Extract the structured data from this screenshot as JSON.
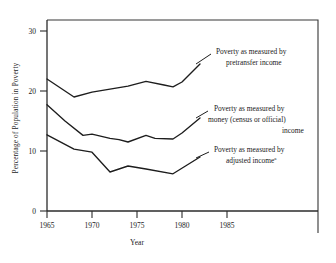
{
  "chart_data": {
    "type": "line",
    "title": "",
    "xlabel": "Year",
    "ylabel": "Percentage of Population in Poverty",
    "xlim": [
      1965,
      1987
    ],
    "ylim": [
      0,
      32
    ],
    "xticks": [
      1965,
      1970,
      1975,
      1980,
      1985
    ],
    "xticklabels": [
      "1965",
      "1970",
      "1975",
      "1980",
      "1985"
    ],
    "yticks": [
      0,
      10,
      20,
      30
    ],
    "yticklabels": [
      "0",
      "10",
      "20",
      "30"
    ],
    "grid": false,
    "legend_position": "inline-annotations",
    "series": [
      {
        "name": "Poverty as measured by pretransfer income",
        "x": [
          1965,
          1968,
          1970,
          1972,
          1974,
          1976,
          1978,
          1979,
          1980,
          1982
        ],
        "values": [
          22.0,
          19.0,
          19.8,
          20.3,
          20.8,
          21.6,
          21.0,
          20.7,
          21.5,
          24.5
        ]
      },
      {
        "name": "Poverty as measured by money (census or official) income",
        "x": [
          1965,
          1967,
          1969,
          1970,
          1972,
          1973,
          1974,
          1976,
          1977,
          1979,
          1980,
          1982
        ],
        "values": [
          17.7,
          15.0,
          12.6,
          12.8,
          12.1,
          11.9,
          11.5,
          12.6,
          12.1,
          12.0,
          13.0,
          15.5
        ]
      },
      {
        "name": "Poverty as measured by adjusted income",
        "x": [
          1965,
          1968,
          1970,
          1972,
          1974,
          1976,
          1979,
          1982
        ],
        "values": [
          12.7,
          10.3,
          9.8,
          6.5,
          7.5,
          7.0,
          6.2,
          9.0
        ]
      }
    ],
    "annotations": [
      {
        "id": "annot-pretransfer",
        "lines": [
          "Poverty as measured by",
          "pretransfer income"
        ],
        "superscript": ""
      },
      {
        "id": "annot-money",
        "lines": [
          "Poverty as measured by",
          "money (census or official)",
          "income"
        ],
        "superscript": ""
      },
      {
        "id": "annot-adjusted",
        "lines": [
          "Poverty as measured by",
          "adjusted income"
        ],
        "superscript": "a"
      }
    ],
    "colors": {
      "line": "#1d1d1d",
      "axis": "#2b2b2b",
      "background": "#ffffff"
    }
  }
}
